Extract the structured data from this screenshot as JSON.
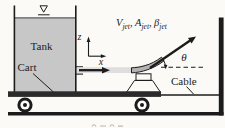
{
  "figure": {
    "labels": {
      "tank": "Tank",
      "cart": "Cart",
      "cable": "Cable",
      "theta": "θ",
      "axis_z": "z",
      "axis_x": "x",
      "jet": {
        "v": "V",
        "a": "A",
        "beta": "β",
        "sub": "jet",
        "sep": ","
      }
    },
    "icons": {
      "free_surface": "∇"
    },
    "colors": {
      "background": "#fbfaf6",
      "ink": "#1c1c1c",
      "tank_fill": "#c7c7c7",
      "jet_stream": "#dedede",
      "cart_platform": "#2b2b2b",
      "pedestal_fill": "#dcdcdc",
      "vane_fill": "#b3b3b3"
    }
  }
}
